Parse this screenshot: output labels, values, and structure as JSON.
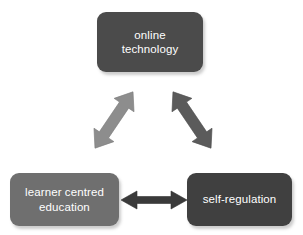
{
  "diagram": {
    "background_color": "#ffffff",
    "nodes": [
      {
        "id": "online-technology",
        "label": "online\ntechnology",
        "lines": [
          "online",
          "technology"
        ],
        "fill_color": "#4b4b4b",
        "text_color": "#ffffff",
        "position": "top"
      },
      {
        "id": "learner-centred-education",
        "label": "learner centred\neducation",
        "lines": [
          "learner centred",
          "education"
        ],
        "fill_color": "#6f6f6f",
        "text_color": "#ffffff",
        "position": "bottom-left"
      },
      {
        "id": "self-regulation",
        "label": "self-regulation",
        "lines": [
          "self-regulation"
        ],
        "fill_color": "#404040",
        "text_color": "#ffffff",
        "position": "bottom-right"
      }
    ],
    "connectors": [
      {
        "id": "online-technology--learner-centred-education",
        "from": "online-technology",
        "to": "learner-centred-education",
        "style": "double-headed-arrow",
        "orientation": "diagonal-down-left",
        "color": "#8d8d8d"
      },
      {
        "id": "online-technology--self-regulation",
        "from": "online-technology",
        "to": "self-regulation",
        "style": "double-headed-arrow",
        "orientation": "diagonal-down-right",
        "color": "#5b5b5b"
      },
      {
        "id": "learner-centred-education--self-regulation",
        "from": "learner-centred-education",
        "to": "self-regulation",
        "style": "double-headed-arrow",
        "orientation": "horizontal",
        "color": "#3a3a3a"
      }
    ]
  }
}
